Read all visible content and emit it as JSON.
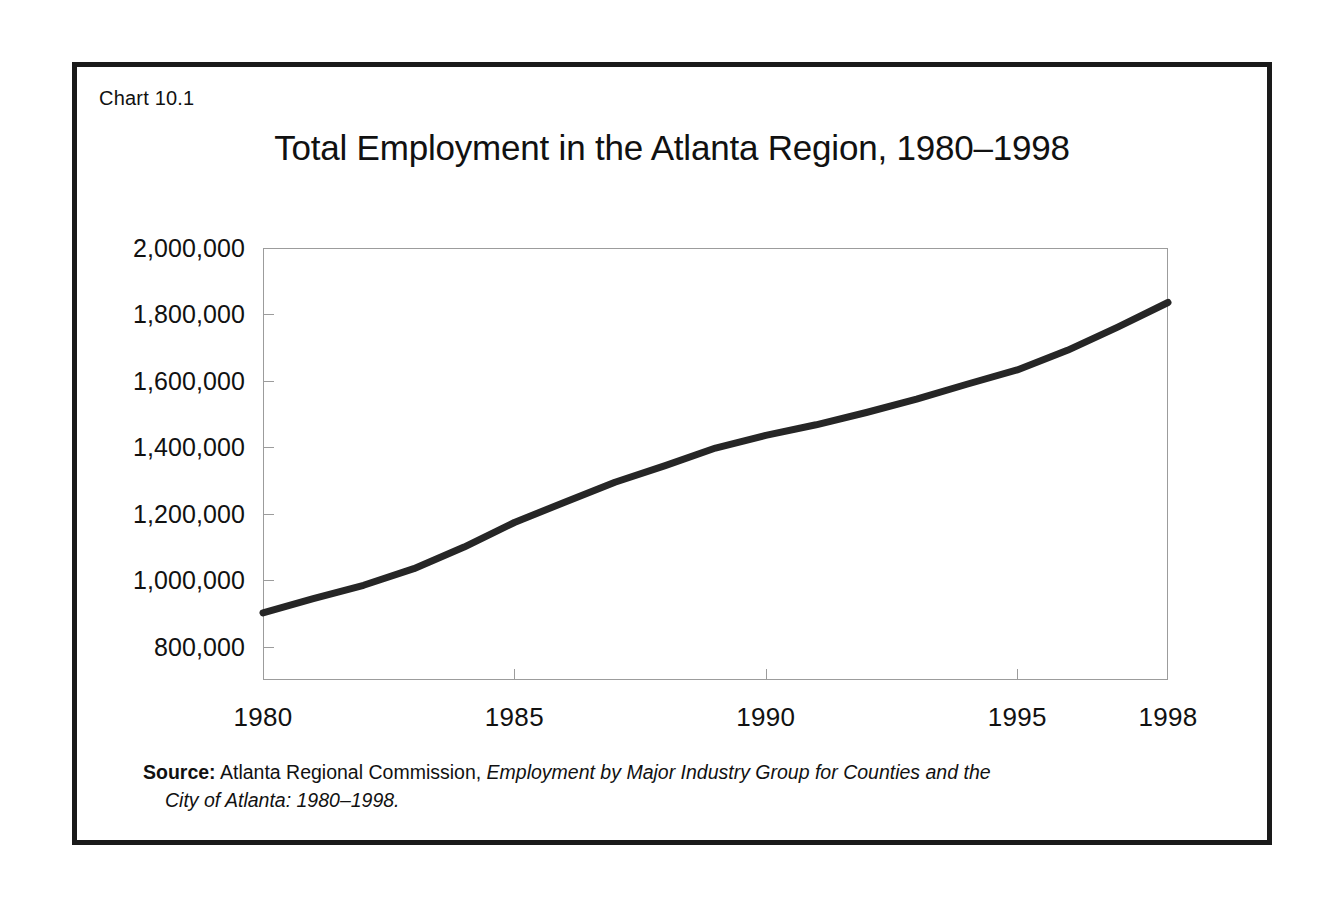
{
  "figure": {
    "number_label": "Chart 10.1",
    "title": "Total Employment in the Atlanta Region, 1980–1998",
    "frame_color": "#1a1a1a",
    "axis_color": "#9c9c9c",
    "line_color": "#262626"
  },
  "source": {
    "label": "Source:",
    "text_before_italic": " Atlanta Regional Commission, ",
    "italic_part": "Employment by Major Industry Group for Counties and the",
    "line2": "City of Atlanta: 1980–1998."
  },
  "chart_data": {
    "type": "line",
    "title": "Total Employment in the Atlanta Region, 1980–1998",
    "subtitle": "",
    "xlabel": "",
    "ylabel": "",
    "grid": false,
    "legend": "none",
    "xlim": [
      1980,
      1998
    ],
    "ylim": [
      700000,
      2000000
    ],
    "x_tick_values": [
      1980,
      1985,
      1990,
      1995,
      1998
    ],
    "x_tick_labels": [
      "1980",
      "1985",
      "1990",
      "1995",
      "1998"
    ],
    "y_tick_values": [
      800000,
      1000000,
      1200000,
      1400000,
      1600000,
      1800000,
      2000000
    ],
    "y_tick_labels": [
      "800,000",
      "1,000,000",
      "1,200,000",
      "1,400,000",
      "1,600,000",
      "1,800,000",
      "2,000,000"
    ],
    "series": [
      {
        "name": "Total Employment",
        "x": [
          1980,
          1981,
          1982,
          1983,
          1984,
          1985,
          1986,
          1987,
          1988,
          1989,
          1990,
          1991,
          1992,
          1993,
          1994,
          1995,
          1996,
          1997,
          1998
        ],
        "values": [
          902000,
          945000,
          985000,
          1035000,
          1100000,
          1174000,
          1235000,
          1295000,
          1345000,
          1398000,
          1436000,
          1468000,
          1505000,
          1545000,
          1590000,
          1633000,
          1692000,
          1762000,
          1836000
        ]
      }
    ]
  }
}
